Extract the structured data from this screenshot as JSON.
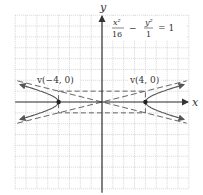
{
  "figure": {
    "equation": {
      "num1": "x²",
      "den1": "16",
      "minus": "−",
      "num2": "y²",
      "den2": "1",
      "eq": "= 1"
    },
    "axes": {
      "x_label": "x",
      "y_label": "y"
    },
    "vertices": [
      {
        "label": "v(−4, 0)",
        "x": -4,
        "y": 0
      },
      {
        "label": "v(4, 0)",
        "x": 4,
        "y": 0
      }
    ],
    "grid": {
      "xmin": -8,
      "xmax": 8,
      "ymin": -8,
      "ymax": 8,
      "step": 1
    },
    "hyperbola": {
      "a": 4,
      "b": 1,
      "orientation": "horizontal"
    },
    "asymptotes": [
      "y = x/4",
      "y = −x/4"
    ],
    "fundamental_rectangle": {
      "x": [
        -4,
        4
      ],
      "y": [
        -1,
        1
      ]
    },
    "colors": {
      "curve": "#555555",
      "grid": "#bbbbbb",
      "axis": "#333333"
    }
  }
}
